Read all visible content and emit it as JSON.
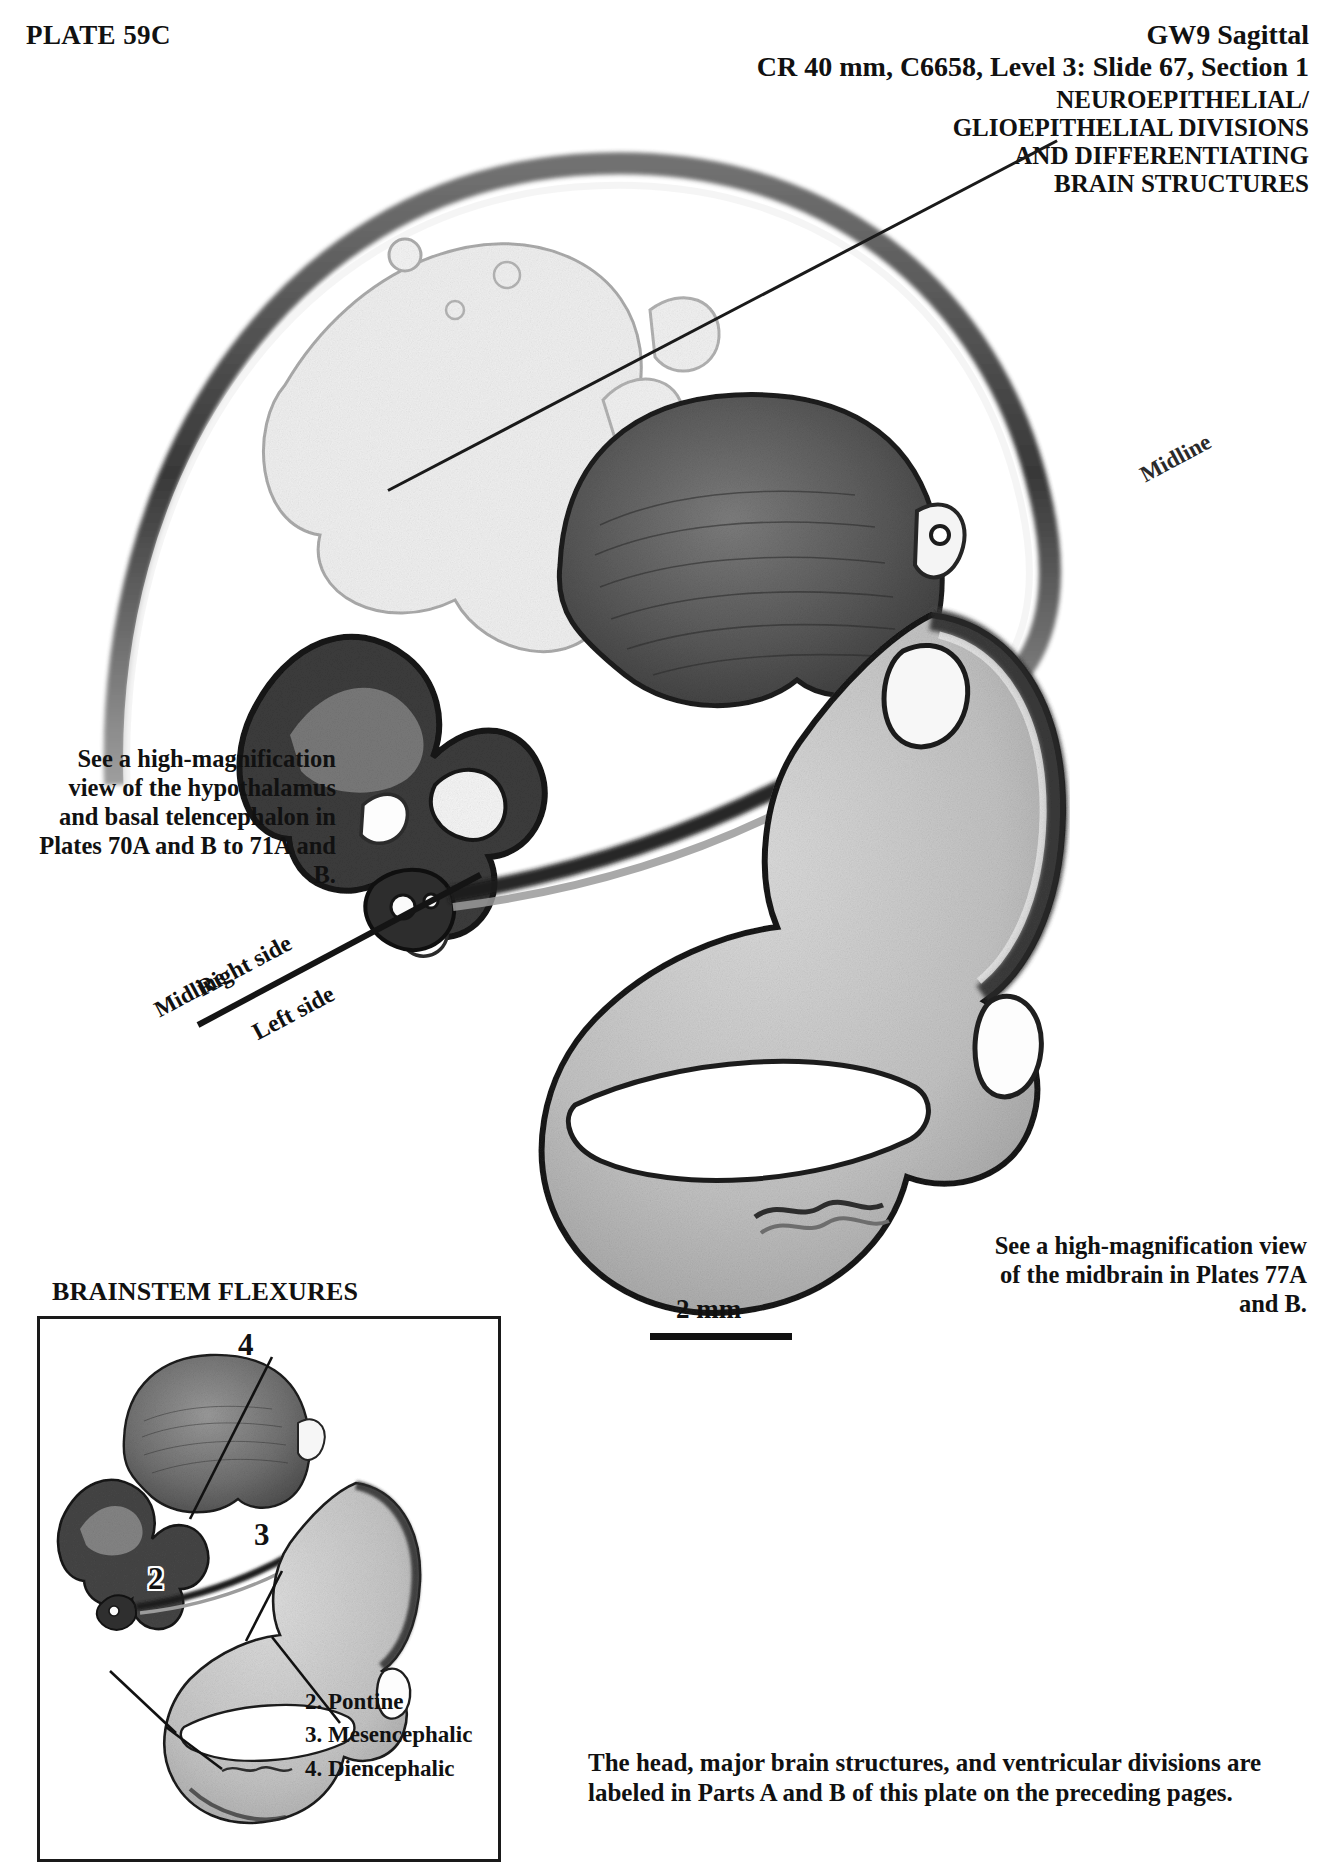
{
  "header": {
    "plate_label": "PLATE 59C",
    "line1": "GW9 Sagittal",
    "line2": "CR 40 mm, C6658, Level 3: Slide 67, Section 1",
    "line3": "NEUROEPITHELIAL/\nGLIOEPITHELIAL DIVISIONS\nAND DIFFERENTIATING\nBRAIN STRUCTURES"
  },
  "callouts": {
    "midline_top": "Midline",
    "midline_bottom": "Midline",
    "right_side": "Right side",
    "left_side": "Left side"
  },
  "notes": {
    "hypothalamus": "See a high-magnification view of the hypothalamus and basal telencephalon in Plates 70A and B to 71A and B.",
    "midbrain": "See a high-magnification view of the midbrain in Plates 77A and B.",
    "parts_ab": "The head, major brain structures, and ventricular divisions are labeled in Parts A and B of this plate on the preceding pages."
  },
  "scale": {
    "label": "2 mm"
  },
  "inset": {
    "title": "BRAINSTEM FLEXURES",
    "legend": [
      "2. Pontine",
      "3. Mesencephalic",
      "4. Diencephalic"
    ],
    "markers": [
      {
        "id": "2",
        "label": "2"
      },
      {
        "id": "3",
        "label": "3"
      },
      {
        "id": "4",
        "label": "4"
      }
    ]
  },
  "colors": {
    "ink": "#111111",
    "paper": "#ffffff",
    "tissue_dark": "#3a3a3a",
    "tissue_mid": "#8a8a8a",
    "tissue_light": "#c9c9c9"
  }
}
